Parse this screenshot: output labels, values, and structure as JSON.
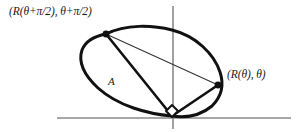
{
  "figure": {
    "labels": {
      "upper_left_point": "(R(θ+π/2), θ+π/2)",
      "right_point": "(R(θ), θ)",
      "region": "A"
    },
    "colors": {
      "curve": "#111111",
      "chord": "#111111",
      "thin_chord": "#333333",
      "axis": "#8a8a8a",
      "marker_fill": "#ffffff",
      "background": "#ffffff",
      "text": "#1a1a1a"
    },
    "axes": {
      "x_axis": {
        "x1": 57,
        "y1": 118,
        "x2": 291,
        "y2": 118
      },
      "y_axis": {
        "x1": 173,
        "y1": 6,
        "x2": 173,
        "y2": 129
      }
    },
    "points": {
      "origin": {
        "x": 172,
        "y": 116
      },
      "upper_left_vertex": {
        "x": 106,
        "y": 34
      },
      "right_vertex": {
        "x": 218,
        "y": 85
      }
    },
    "boundary_curve": "M 106 34 C 126 24, 152 25, 172 30 C 196 36, 214 54, 220 72 C 224 84, 222 96, 212 106 C 200 116, 186 118, 172 116 C 148 114, 118 106, 98 88 C 84 75, 78 62, 82 50 C 86 40, 95 36, 106 34 Z",
    "chords": [
      {
        "name": "origin-to-upper-left",
        "x1": 172,
        "y1": 116,
        "x2": 106,
        "y2": 34,
        "weight": "thick"
      },
      {
        "name": "origin-to-right",
        "x1": 172,
        "y1": 116,
        "x2": 218,
        "y2": 85,
        "weight": "thick"
      },
      {
        "name": "upper-left-to-right",
        "x1": 106,
        "y1": 34,
        "x2": 218,
        "y2": 85,
        "weight": "thin"
      }
    ],
    "right_angle_marker": {
      "name": "right-angle-marker-at-origin",
      "path": "M 166 111 L 172 105 L 178 111 L 172 117 Z"
    }
  }
}
